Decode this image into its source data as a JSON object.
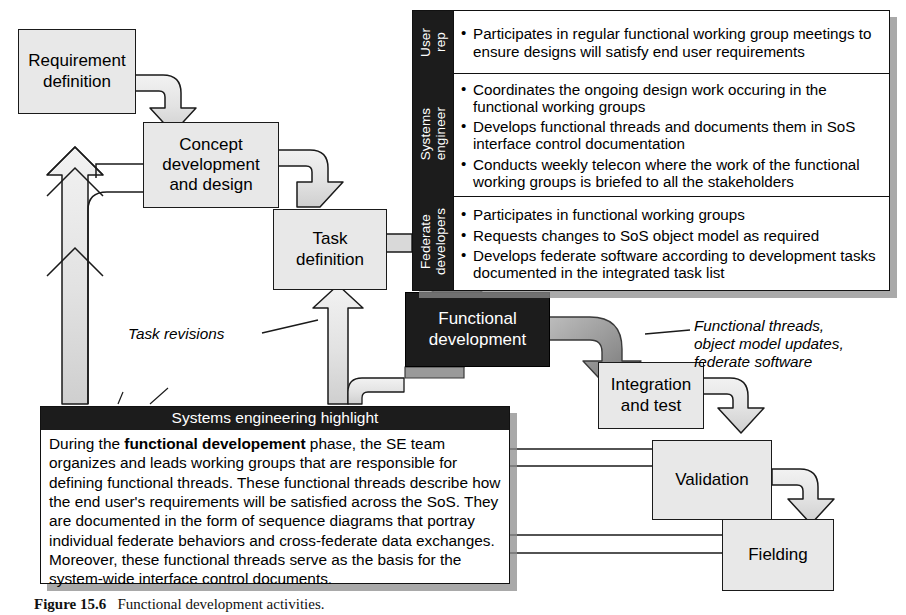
{
  "figure": {
    "caption_label": "Figure 15.6",
    "caption_text": "Functional development activities."
  },
  "process_boxes": [
    {
      "id": "requirement-definition",
      "label": "Requirement\ndefinition",
      "style": "light"
    },
    {
      "id": "concept-development-and-design",
      "label": "Concept\ndevelopment\nand design",
      "style": "light"
    },
    {
      "id": "task-definition",
      "label": "Task\ndefinition",
      "style": "light"
    },
    {
      "id": "functional-development",
      "label": "Functional\ndevelopment",
      "style": "dark"
    },
    {
      "id": "integration-and-test",
      "label": "Integration\nand test",
      "style": "light"
    },
    {
      "id": "validation",
      "label": "Validation",
      "style": "light"
    },
    {
      "id": "fielding",
      "label": "Fielding",
      "style": "light"
    }
  ],
  "role_table": {
    "rows": [
      {
        "role": "User\nrep",
        "bullets": [
          "Participates in regular functional working group meetings to ensure designs will satisfy end user requirements"
        ]
      },
      {
        "role": "Systems\nengineer",
        "bullets": [
          "Coordinates the ongoing design work occuring in the functional working groups",
          "Develops functional threads and documents them in SoS interface control documentation",
          "Conducts weekly telecon where the work of the functional working groups is briefed to all the stakeholders"
        ]
      },
      {
        "role": "Federate\ndevelopers",
        "bullets": [
          "Participates in functional working groups",
          "Requests changes to SoS object model as required",
          "Develops federate software according to development tasks documented in the integrated task list"
        ]
      }
    ]
  },
  "se_highlight": {
    "title": "Systems engineering highlight",
    "text_before_bold": "During the ",
    "bold_phrase": "functional developement",
    "text_after_bold": " phase, the SE team organizes and leads working groups that are responsible for defining functional threads. These functional threads describe how the end user's requirements will be satisfied across the SoS. They are documented in the form of sequence diagrams that portray individual federate behaviors and cross-federate data exchanges. Moreover, these functional threads serve as the basis for the system-wide interface control documents."
  },
  "callouts": [
    {
      "id": "task-revisions",
      "text": "Task revisions"
    },
    {
      "id": "functional-threads-outputs",
      "text": "Functional threads,\nobject model updates,\nfederate software"
    }
  ],
  "colors": {
    "box_fill": "#e8e8e8",
    "dark_fill": "#1c1c1c",
    "arrow_fill": "#e3e3e3",
    "dark_arrow_fill": "#8e8e8e",
    "outline": "#1a1a1a",
    "shadow": "#8c8c8c"
  }
}
